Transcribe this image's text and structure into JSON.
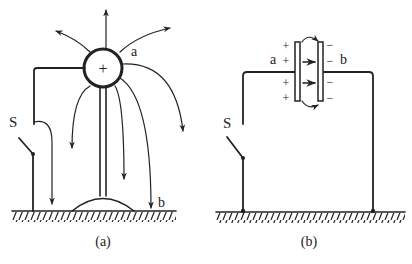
{
  "figure_a": {
    "caption": "(a)",
    "sphere_charge": "+",
    "label_a": "a",
    "label_b": "b",
    "switch_label": "S"
  },
  "figure_b": {
    "caption": "(b)",
    "label_a": "a",
    "label_b": "b",
    "switch_label": "S",
    "plate_a_charges": [
      "+",
      "+",
      "+",
      "+"
    ],
    "plate_b_charges": [
      "−",
      "−",
      "−",
      "−"
    ]
  },
  "colors": {
    "ink": "#222222",
    "background": "#ffffff"
  }
}
